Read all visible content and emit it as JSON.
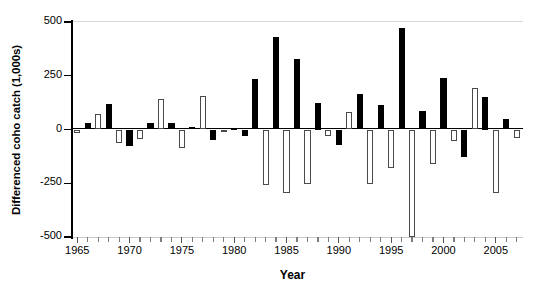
{
  "chart_data": {
    "type": "bar",
    "title": "",
    "xlabel": "Year",
    "ylabel": "Differenced coho catch (1,000s)",
    "ylim": [
      -500,
      500
    ],
    "yticks": [
      500,
      250,
      0,
      -250,
      -500
    ],
    "ytick_labels": [
      "500",
      "250",
      "0",
      "-250",
      "-500"
    ],
    "xlim": [
      1964.4,
      2007.6
    ],
    "xticks": [
      1965,
      1970,
      1975,
      1980,
      1985,
      1990,
      1995,
      2000,
      2005
    ],
    "xtick_labels": [
      "1965",
      "1970",
      "1975",
      "1980",
      "1985",
      "1990",
      "1995",
      "2000",
      "2005"
    ],
    "grid": false,
    "legend": "none",
    "series_note": "Bars alternate fill: black (filled) and white (hollow) markers denote sign-alternating differenced values",
    "categories": [
      1965,
      1966,
      1967,
      1968,
      1969,
      1970,
      1971,
      1972,
      1973,
      1974,
      1975,
      1976,
      1977,
      1978,
      1979,
      1980,
      1981,
      1982,
      1983,
      1984,
      1985,
      1986,
      1987,
      1988,
      1989,
      1990,
      1991,
      1992,
      1993,
      1994,
      1995,
      1996,
      1997,
      1998,
      1999,
      2000,
      2001,
      2002,
      2003,
      2004,
      2005,
      2006,
      2007
    ],
    "values": [
      -16,
      28,
      70,
      118,
      -62,
      -78,
      -45,
      30,
      140,
      30,
      -88,
      12,
      155,
      -48,
      -4,
      8,
      -28,
      235,
      -258,
      430,
      -295,
      330,
      -255,
      125,
      -30,
      -70,
      82,
      165,
      -255,
      115,
      -178,
      470,
      -500,
      88,
      -160,
      240,
      -55,
      -130,
      195,
      150,
      -295,
      48,
      -40
    ],
    "colors": [
      "hollow",
      "filled",
      "hollow",
      "filled",
      "hollow",
      "filled",
      "hollow",
      "filled",
      "hollow",
      "filled",
      "hollow",
      "filled",
      "hollow",
      "filled",
      "hollow",
      "filled",
      "filled",
      "filled",
      "hollow",
      "filled",
      "hollow",
      "filled",
      "hollow",
      "filled",
      "hollow",
      "filled",
      "hollow",
      "filled",
      "hollow",
      "filled",
      "hollow",
      "filled",
      "hollow",
      "filled",
      "hollow",
      "filled",
      "hollow",
      "filled",
      "hollow",
      "filled",
      "hollow",
      "filled",
      "hollow"
    ]
  }
}
